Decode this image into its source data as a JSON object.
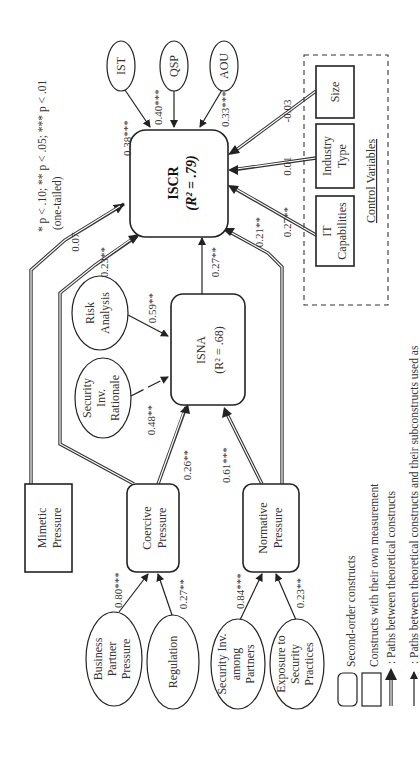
{
  "diagram": {
    "orientation": "rotated 90 degrees counter-clockwise",
    "significance_note": [
      "* p < .10; ** p < .05; *** p < .01",
      "(one-tailed)"
    ],
    "nodes": {
      "iscr": {
        "title": "ISCR",
        "r2": "(R² = .79)",
        "type": "second-order"
      },
      "isna": {
        "title": "ISNA",
        "r2": "(R² = .68)",
        "type": "second-order"
      },
      "mimetic": {
        "lines": [
          "Mimetic",
          "Pressure"
        ],
        "type": "own-measurement"
      },
      "coercive": {
        "lines": [
          "Coercive",
          "Pressure"
        ],
        "type": "second-order"
      },
      "normative": {
        "lines": [
          "Normative",
          "Pressure"
        ],
        "type": "second-order"
      },
      "ist": {
        "label": "IST"
      },
      "qsp": {
        "label": "QSP"
      },
      "aou": {
        "label": "AOU"
      },
      "risk": {
        "lines": [
          "Risk",
          "Analysis"
        ]
      },
      "secinvrat": {
        "lines": [
          "Security",
          "Inv.",
          "Rationale"
        ]
      },
      "bpp": {
        "lines": [
          "Business",
          "Partner",
          "Pressure"
        ]
      },
      "regulation": {
        "label": "Regulation"
      },
      "sia": {
        "lines": [
          "Security Inv.",
          "among",
          "Partners"
        ]
      },
      "esp": {
        "lines": [
          "Exposure to",
          "Security",
          "Practices"
        ]
      },
      "itcap": {
        "lines": [
          "IT",
          "Capabilities"
        ]
      },
      "industry": {
        "lines": [
          "Industry",
          "Type"
        ]
      },
      "size": {
        "label": "Size"
      }
    },
    "control_variables_label": "Control Variables",
    "paths": {
      "ist_iscr": "0.38***",
      "qsp_iscr": "0.40***",
      "aou_iscr": "0.33***",
      "mimetic_iscr": "0.07",
      "coercive_iscr": "0.23**",
      "isna_iscr": "0.27**",
      "normative_iscr": "0.21**",
      "itcap_iscr": "0.27**",
      "industry_iscr": "0.01",
      "size_iscr": "-0.03",
      "risk_isna": "0.59**",
      "secinvrat_isna": "0.48**",
      "coercive_isna": "0.26**",
      "normative_isna": "0.61***",
      "bpp_coercive": "0.80***",
      "regulation_coercive": "0.27**",
      "sia_normative": "0.84***",
      "esp_normative": "0.23**"
    },
    "legend": {
      "second_order": "Second-order constructs",
      "own_measurement": "Constructs with their own measurement",
      "theoretical_paths": ": Paths between theoretical constructs",
      "sub_paths": ": Paths between theoretical constructs and their subconstructs used as"
    }
  }
}
